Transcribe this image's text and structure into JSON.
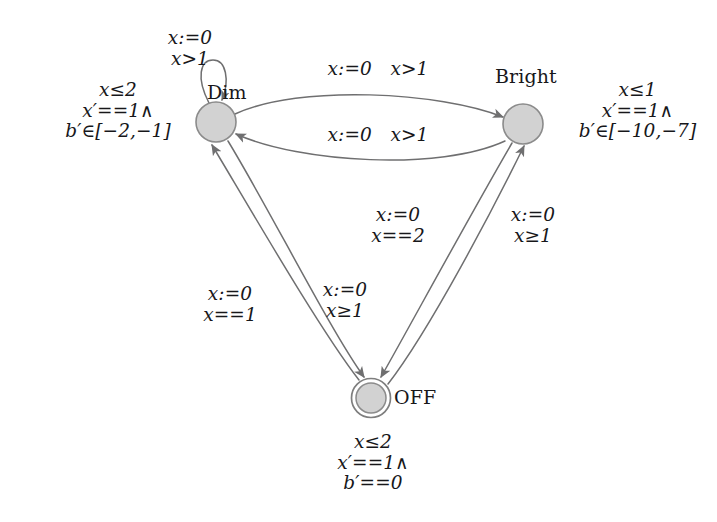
{
  "diagram": {
    "kind": "timed-automaton",
    "title": "",
    "colors": {
      "node_fill": "#d2d2d2",
      "node_stroke": "#8b8b8b",
      "edge_stroke": "#6f6f70",
      "text": "#17171a",
      "background": "#ffffff"
    },
    "states": [
      {
        "id": "dim",
        "label": "Dim",
        "shape": "circle",
        "accepting": false,
        "cx": 216,
        "cy": 122,
        "r": 20,
        "invariant": {
          "line1": "x≤2",
          "line2": "x′==1∧",
          "line3": "b′∈[−2,−1]"
        }
      },
      {
        "id": "bright",
        "label": "Bright",
        "shape": "circle",
        "accepting": false,
        "cx": 523,
        "cy": 124,
        "r": 20,
        "invariant": {
          "line1": "x≤1",
          "line2": "x′==1∧",
          "line3": "b′∈[−10,−7]"
        }
      },
      {
        "id": "off",
        "label": "OFF",
        "shape": "double-circle",
        "accepting": true,
        "cx": 371,
        "cy": 398,
        "r": 19,
        "invariant": {
          "line1": "x≤2",
          "line2": "x′==1∧",
          "line3": "b′==0"
        }
      }
    ],
    "transitions": [
      {
        "id": "dim-self",
        "from": "dim",
        "to": "dim",
        "kind": "self-loop",
        "label_line1": "x:=0",
        "label_line2": "x>1"
      },
      {
        "id": "dim-to-bright",
        "from": "dim",
        "to": "bright",
        "kind": "curve-top",
        "label_line1": "x:=0",
        "label_line2": "x>1",
        "label_inline": "x:=0 x>1"
      },
      {
        "id": "bright-to-dim",
        "from": "bright",
        "to": "dim",
        "kind": "curve-bottom",
        "label_line1": "x:=0",
        "label_line2": "x>1",
        "label_inline": "x:=0 x>1"
      },
      {
        "id": "off-to-dim",
        "from": "off",
        "to": "dim",
        "kind": "straight",
        "label_line1": "x:=0",
        "label_line2": "x==1"
      },
      {
        "id": "dim-to-off",
        "from": "dim",
        "to": "off",
        "kind": "straight",
        "label_line1": "x:=0",
        "label_line2": "x≥1"
      },
      {
        "id": "bright-to-off",
        "from": "bright",
        "to": "off",
        "kind": "straight",
        "label_line1": "x:=0",
        "label_line2": "x==2"
      },
      {
        "id": "off-to-bright",
        "from": "off",
        "to": "bright",
        "kind": "straight",
        "label_line1": "x:=0",
        "label_line2": "x≥1"
      }
    ]
  }
}
